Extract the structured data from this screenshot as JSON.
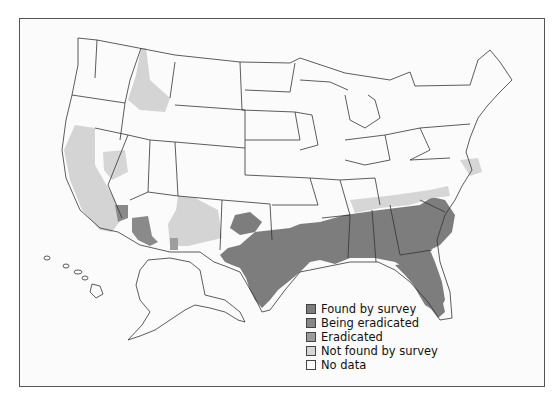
{
  "colors": {
    "found_by_survey": "#7d7d7d",
    "being_eradicated": "#8a8a8a",
    "eradicated": "#9d9d9d",
    "not_found_by_survey": "#d4d4d4",
    "no_data": "#fbfbfb",
    "state_border": "#333333"
  },
  "legend": {
    "items": [
      {
        "label": "Found by survey",
        "color": "#7d7d7d"
      },
      {
        "label": "Being eradicated",
        "color": "#878787"
      },
      {
        "label": "Eradicated",
        "color": "#9b9b9b"
      },
      {
        "label": "Not found by survey",
        "color": "#d6d6d6"
      },
      {
        "label": "No data",
        "color": "#fbfbfb"
      }
    ]
  }
}
